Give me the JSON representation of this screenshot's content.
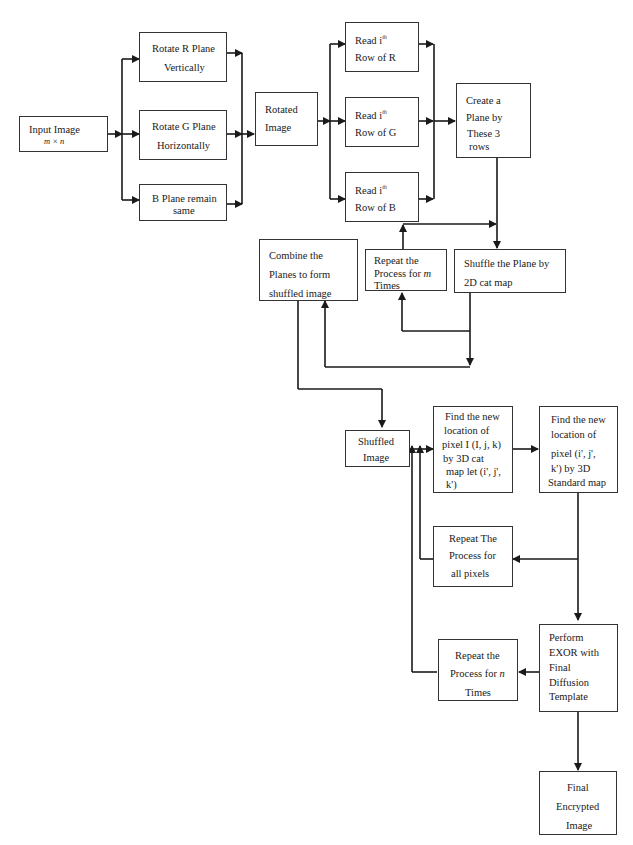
{
  "diagram": {
    "nodes": {
      "input_image": {
        "line1": "Input Image",
        "line2": "m × n"
      },
      "rotate_r": {
        "line1": "Rotate R Plane",
        "line2": "Vertically"
      },
      "rotate_g": {
        "line1": "Rotate G Plane",
        "line2": "Horizontally"
      },
      "b_plane": {
        "line1": "B Plane remain",
        "line2": "same"
      },
      "rotated_image": {
        "line1": "Rotated",
        "line2": "Image"
      },
      "read_r": {
        "line1": "Read i",
        "sup": "th",
        "line2": "Row of R"
      },
      "read_g": {
        "line1": "Read i",
        "sup": "th",
        "line2": "Row of G"
      },
      "read_b": {
        "line1": "Read i",
        "sup": "th",
        "line2": "Row of B"
      },
      "create_plane": {
        "line1": "Create a",
        "line2": "Plane by",
        "line3": "These 3",
        "line4": "rows"
      },
      "combine_planes": {
        "line1": "Combine the",
        "line2": "Planes to form",
        "line3": "shuffled image"
      },
      "repeat_m": {
        "line1": "Repeat  the",
        "line2": "Process  for ",
        "var": "m",
        "line3": "Times"
      },
      "shuffle_plane": {
        "line1": "Shuffle  the  Plane  by",
        "line2": "2D cat map"
      },
      "shuffled_image": {
        "line1": "Shuffled",
        "line2": "Image"
      },
      "find_3d_cat": {
        "line1": "Find the new",
        "line2": "location of",
        "line3": "pixel I (I, j, k)",
        "line4": "by 3D cat",
        "line5": "map let (i', j',",
        "line6": "k')"
      },
      "find_3d_standard": {
        "line1": "Find  the  new",
        "line2": "location of",
        "line3": "pixel (i', j',",
        "line4": "k') by 3D",
        "line5": "Standard map"
      },
      "repeat_pixels": {
        "line1": "Repeat The",
        "line2": "Process for",
        "line3": "all pixels"
      },
      "perform_exor": {
        "line1": "Perform",
        "line2": "EXOR with",
        "line3": "Final",
        "line4": "Diffusion",
        "line5": "Template"
      },
      "repeat_n": {
        "line1": "Repeat the",
        "line2": "Process for ",
        "var": "n",
        "line3": "Times"
      },
      "final_encrypted": {
        "line1": "Final",
        "line2": "Encrypted",
        "line3": "Image"
      }
    },
    "colors": {
      "line": "#1a1a1a",
      "border": "#333333",
      "background": "#ffffff"
    }
  }
}
